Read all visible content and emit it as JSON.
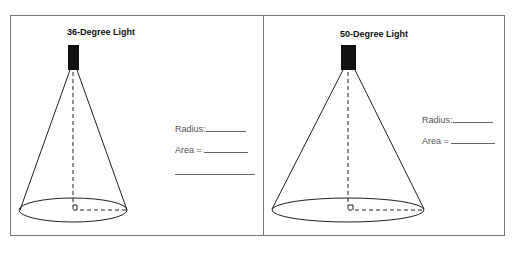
{
  "panels": [
    {
      "title": "36-Degree Light",
      "radius_label": "Radius:",
      "area_label": "Area ="
    },
    {
      "title": "50-Degree Light",
      "radius_label": "Radius:",
      "area_label": "Area ="
    }
  ],
  "colors": {
    "frame": "#777777",
    "ink": "#111111",
    "label": "#555555"
  }
}
